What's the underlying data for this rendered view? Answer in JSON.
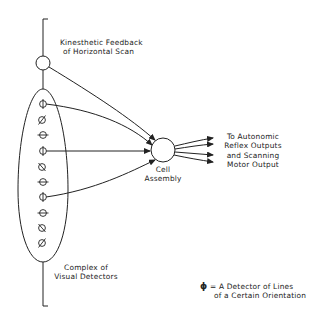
{
  "labels": {
    "kinesthetic_line1": "Kinesthetic Feedback",
    "kinesthetic_line2": "of Horizontal Scan",
    "cell_line1": "Cell",
    "cell_line2": "Assembly",
    "outputs_line1": "To Autonomic",
    "outputs_line2": "Reflex Outputs",
    "outputs_line3": "and Scanning",
    "outputs_line4": "Motor Output",
    "complex_line1": "Complex of",
    "complex_line2": "Visual Detectors",
    "legend_line1": "= A Detector of Lines",
    "legend_line2": "of a Certain Orientation",
    "legend_symbol": "ϕ"
  },
  "detectors": [
    {
      "orientation": "vertical",
      "connected": true
    },
    {
      "orientation": "diagonal",
      "connected": false
    },
    {
      "orientation": "horizontal",
      "connected": false
    },
    {
      "orientation": "vertical",
      "connected": true
    },
    {
      "orientation": "diagonal-left",
      "connected": false
    },
    {
      "orientation": "horizontal",
      "connected": false
    },
    {
      "orientation": "vertical",
      "connected": true
    },
    {
      "orientation": "horizontal",
      "connected": false
    },
    {
      "orientation": "diagonal-left",
      "connected": false
    },
    {
      "orientation": "diagonal",
      "connected": false
    }
  ],
  "colors": {
    "ink": "#222222",
    "background": "#ffffff"
  }
}
